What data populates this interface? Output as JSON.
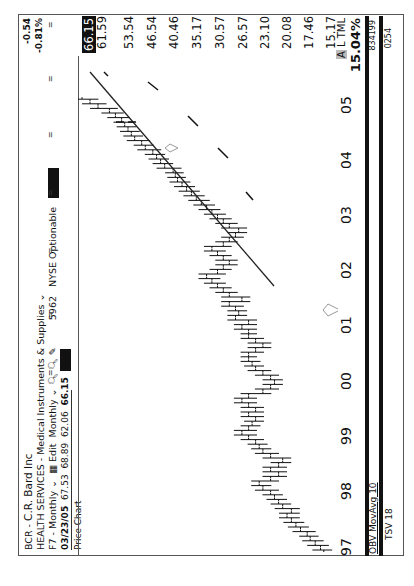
{
  "header": {
    "symbol": "BCR",
    "name": "C.R. Bard Inc",
    "sector": "HEALTH SERVICES",
    "industry": "Medical Instruments & Supplies",
    "period_menu": "F7 - Monthly",
    "edit_label": "Edit",
    "interval": "Monthly",
    "volume_code": "5962",
    "exchange": "NYSE Optionable",
    "quote": {
      "date": "03/23/05",
      "open": "67.53",
      "high": "68.89",
      "low": "62.06",
      "close": "66.15"
    },
    "panel_label": "Price Chart"
  },
  "change": {
    "abs": "-0.54",
    "pct": "-0.81%"
  },
  "price_axis": [
    "66.15",
    "61.59",
    "53.54",
    "46.54",
    "40.46",
    "35.17",
    "30.57",
    "26.57",
    "23.10",
    "20.08",
    "17.46",
    "15.17"
  ],
  "time_axis": [
    "97",
    "98",
    "99",
    "00",
    "01",
    "02",
    "03",
    "04",
    "05"
  ],
  "right_badge": {
    "letter": "A",
    "label": "L TML",
    "value": "15.04%"
  },
  "indicators": {
    "obv": {
      "label": "OBV MovAvg 10",
      "value": "834199"
    },
    "tsv": {
      "label": "TSV 18",
      "value": "0254"
    }
  },
  "chart_data": {
    "type": "ohlc",
    "xlabel": "Year",
    "ylabel": "Price (log scale)",
    "x_ticks": [
      "97",
      "98",
      "99",
      "00",
      "01",
      "02",
      "03",
      "04",
      "05"
    ],
    "y_ticks": [
      66.15,
      61.59,
      53.54,
      46.54,
      40.46,
      35.17,
      30.57,
      26.57,
      23.1,
      20.08,
      17.46,
      15.17
    ],
    "approx_monthly_close": {
      "1997": [
        15.5,
        16,
        16.5,
        16.8,
        17.5,
        18,
        18.5,
        19,
        18.5,
        19.5,
        20,
        20.5
      ],
      "1998": [
        21,
        22,
        22.5,
        21,
        20,
        21,
        20,
        19.5,
        21,
        22,
        22.5,
        23
      ],
      "1999": [
        24,
        25,
        24,
        23.5,
        23,
        24,
        23,
        24,
        25,
        24,
        22,
        21
      ],
      "2000": [
        20.5,
        21,
        22,
        23,
        23.5,
        24,
        24,
        23,
        22,
        23,
        24,
        24
      ],
      "2001": [
        25,
        24,
        26,
        25.5,
        26,
        27,
        25,
        27,
        28,
        29,
        30,
        31
      ],
      "2002": [
        29,
        28,
        27,
        28,
        29,
        30,
        28,
        27,
        26,
        25.5,
        27,
        28
      ],
      "2003": [
        29,
        30,
        31,
        32,
        33,
        34,
        35,
        36,
        37,
        37.5,
        38,
        40
      ],
      "2004": [
        41,
        42,
        43,
        45,
        46,
        48,
        49,
        50,
        51,
        52,
        54,
        56
      ],
      "2005": [
        60,
        63,
        66.15
      ]
    },
    "last": {
      "date": "03/23/05",
      "open": 67.53,
      "high": 68.89,
      "low": 62.06,
      "close": 66.15
    },
    "trendline": {
      "from": {
        "x": "2002-07",
        "y": 24.5
      },
      "to": {
        "x": "2005-03",
        "y": 61.59
      }
    },
    "indicators": [
      "OBV MovAvg 10",
      "TSV 18"
    ],
    "grid": false
  }
}
